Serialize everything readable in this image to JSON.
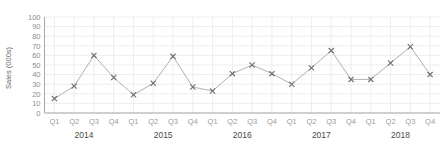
{
  "chart_data": {
    "type": "line",
    "title": "",
    "subtitle": "",
    "xlabel": "",
    "ylabel": "Sales (000s)",
    "ylim": [
      0,
      100
    ],
    "ytick_step": 10,
    "yticks": [
      "0",
      "10",
      "20",
      "30",
      "40",
      "50",
      "60",
      "70",
      "80",
      "90",
      "100"
    ],
    "grid": true,
    "legend": "none",
    "marker": "x",
    "categories": [
      "Q1",
      "Q2",
      "Q3",
      "Q4",
      "Q1",
      "Q2",
      "Q3",
      "Q4",
      "Q1",
      "Q2",
      "Q3",
      "Q4",
      "Q1",
      "Q2",
      "Q3",
      "Q4",
      "Q1",
      "Q2",
      "Q3",
      "Q4"
    ],
    "group_labels": [
      "2014",
      "2015",
      "2016",
      "2017",
      "2018"
    ],
    "values": [
      15,
      28,
      60,
      37,
      19,
      31,
      59,
      27,
      23,
      41,
      50,
      41,
      30,
      47,
      65,
      35,
      35,
      52,
      69,
      40
    ],
    "series": [
      {
        "name": "Sales",
        "values": [
          15,
          28,
          60,
          37,
          19,
          31,
          59,
          27,
          23,
          41,
          50,
          41,
          30,
          47,
          65,
          35,
          35,
          52,
          69,
          40
        ]
      }
    ],
    "colors": {
      "line": "#b0b0b0",
      "marker": "#6e6e6e",
      "grid": "#ededed",
      "axis": "#a8a8a8",
      "background": "#ffffff",
      "tick_text": "#8e8e8e",
      "group_text": "#4a4a4a",
      "axis_title": "#6a6a6a"
    }
  }
}
